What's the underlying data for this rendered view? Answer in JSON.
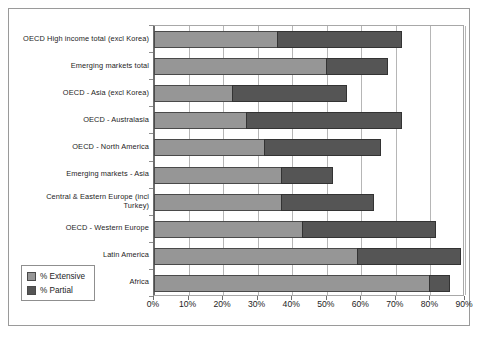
{
  "chart_data": {
    "type": "bar",
    "orientation": "horizontal",
    "stacked": true,
    "title": "",
    "xlabel": "",
    "ylabel": "",
    "xlim": [
      0,
      90
    ],
    "grid": true,
    "legend_position": "bottom-left",
    "xticks": [
      "0%",
      "10%",
      "20%",
      "30%",
      "40%",
      "50%",
      "60%",
      "70%",
      "80%",
      "90%"
    ],
    "xtick_values": [
      0,
      10,
      20,
      30,
      40,
      50,
      60,
      70,
      80,
      90
    ],
    "categories": [
      "OECD High income total (excl Korea)",
      "Emerging markets total",
      "OECD - Asia (excl Korea)",
      "OECD - Australasia",
      "OECD - North America",
      "Emerging markets - Asia",
      "Central & Eastern Europe (incl Turkey)",
      "OECD - Western Europe",
      "Latin America",
      "Africa"
    ],
    "series": [
      {
        "name": "% Extensive",
        "color": "#969696",
        "values": [
          36,
          50,
          23,
          27,
          32,
          37,
          37,
          43,
          59,
          80
        ]
      },
      {
        "name": "% Partial",
        "color": "#555555",
        "values": [
          36,
          18,
          33,
          45,
          34,
          15,
          27,
          39,
          30,
          6
        ]
      }
    ],
    "cumulative_totals": [
      72,
      68,
      56,
      72,
      66,
      52,
      64,
      82,
      89,
      86
    ]
  },
  "legend": {
    "items": [
      {
        "label": "% Extensive",
        "swatch": "ext"
      },
      {
        "label": "% Partial",
        "swatch": "part"
      }
    ]
  }
}
